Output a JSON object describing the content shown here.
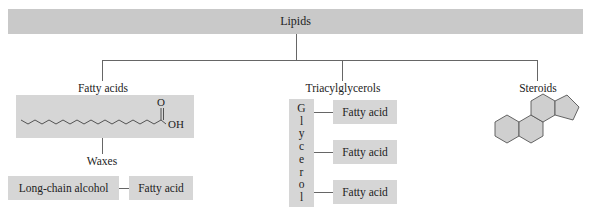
{
  "diagram": {
    "root": {
      "label": "Lipids"
    },
    "branches": [
      {
        "label": "Fatty acids",
        "structure": {
          "type": "fatty-acid-chain",
          "carbonyl_label": "O",
          "hydroxyl_label": "OH"
        },
        "child": {
          "label": "Waxes",
          "components": [
            "Long-chain alcohol",
            "Fatty acid"
          ]
        }
      },
      {
        "label": "Triacylglycerols",
        "backbone": {
          "label": "Glycerol",
          "letters": [
            "G",
            "l",
            "y",
            "c",
            "e",
            "r",
            "o",
            "l"
          ]
        },
        "components": [
          "Fatty acid",
          "Fatty acid",
          "Fatty acid"
        ]
      },
      {
        "label": "Steroids",
        "structure": {
          "type": "steroid-four-ring"
        }
      }
    ],
    "colors": {
      "box_fill": "#d6d6d6",
      "banner_fill": "#c9c9c9",
      "line": "#666666"
    }
  }
}
